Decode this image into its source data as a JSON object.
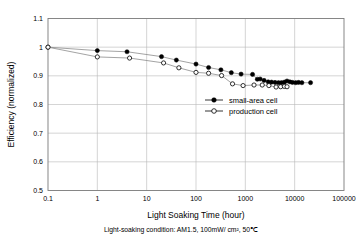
{
  "chart_data": {
    "type": "line",
    "title": "",
    "xlabel": "Light Soaking Time (hour)",
    "ylabel": "Efficiency (normalized)",
    "xscale": "log",
    "yscale": "linear",
    "xlim": [
      0.1,
      100000
    ],
    "ylim": [
      0.5,
      1.1
    ],
    "grid": true,
    "legend_position": "center-right",
    "xticks": [
      "0.1",
      "1",
      "10",
      "100",
      "1000",
      "10000",
      "100000"
    ],
    "xtick_values": [
      0.1,
      1,
      10,
      100,
      1000,
      10000,
      100000
    ],
    "yticks": [
      "0.5",
      "0.6",
      "0.7",
      "0.8",
      "0.9",
      "1",
      "1.1"
    ],
    "ytick_values": [
      0.5,
      0.6,
      0.7,
      0.8,
      0.9,
      1.0,
      1.1
    ],
    "annotation": "Light-soaking condition: AM1.5, 100mW/ cm², 50℃",
    "series": [
      {
        "name": "small-area cell",
        "marker": "filled-circle",
        "color": "#000000",
        "x": [
          0.1,
          1,
          4,
          20,
          40,
          100,
          180,
          320,
          520,
          820,
          1400,
          1750,
          2000,
          2400,
          2900,
          3400,
          4000,
          4700,
          5400,
          6200,
          7000,
          8000,
          9000,
          10500,
          12000,
          14000,
          21000
        ],
        "y": [
          1.0,
          0.988,
          0.984,
          0.967,
          0.955,
          0.941,
          0.929,
          0.921,
          0.911,
          0.906,
          0.905,
          0.888,
          0.889,
          0.884,
          0.879,
          0.878,
          0.877,
          0.876,
          0.876,
          0.878,
          0.882,
          0.879,
          0.877,
          0.876,
          0.877,
          0.876,
          0.876
        ]
      },
      {
        "name": "production cell",
        "marker": "open-circle",
        "color": "#000000",
        "x": [
          0.1,
          1,
          4.5,
          22,
          45,
          100,
          180,
          330,
          550,
          900,
          1500,
          2200,
          3000,
          4200,
          5200,
          6200,
          7000
        ],
        "y": [
          1.0,
          0.966,
          0.962,
          0.945,
          0.928,
          0.912,
          0.909,
          0.901,
          0.872,
          0.866,
          0.868,
          0.868,
          0.866,
          0.861,
          0.862,
          0.863,
          0.862
        ]
      }
    ]
  },
  "legend": {
    "entries": [
      {
        "label": "small-area cell",
        "marker": "filled-circle"
      },
      {
        "label": "production cell",
        "marker": "open-circle"
      }
    ]
  },
  "caption": {
    "text": "Light-soaking condition: AM1.5, 100mW/ cm², 50℃"
  }
}
